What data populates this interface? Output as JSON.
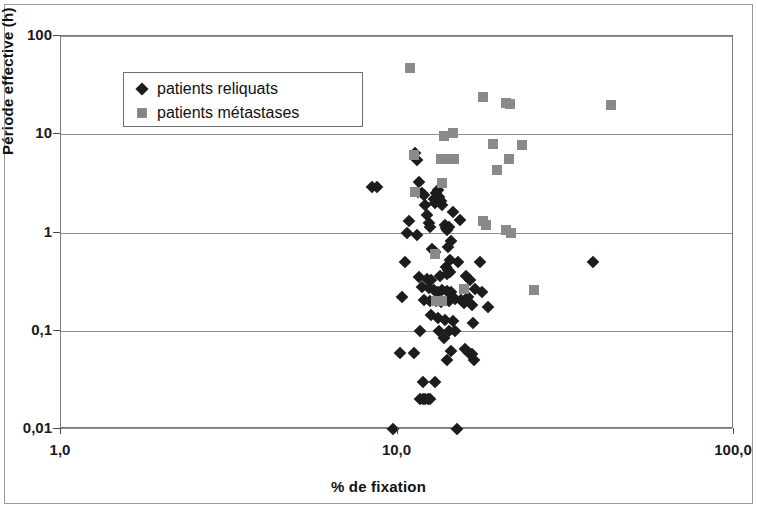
{
  "chart_data": {
    "type": "scatter",
    "title": "",
    "xlabel": "% de fixation",
    "ylabel": "Période effective (h)",
    "xscale": "log",
    "yscale": "log",
    "xlim": [
      1.0,
      100.0
    ],
    "ylim": [
      0.01,
      100
    ],
    "xticks": [
      "1,0",
      "10,0",
      "100,0"
    ],
    "xtick_values": [
      1.0,
      10.0,
      100.0
    ],
    "yticks": [
      "0,01",
      "0,1",
      "1",
      "10",
      "100"
    ],
    "ytick_values": [
      0.01,
      0.1,
      1,
      10,
      100
    ],
    "grid": "horizontal",
    "legend_position": "top-left",
    "series": [
      {
        "name": "patients reliquats",
        "marker": "diamond",
        "color": "#1c1c1c",
        "points": [
          [
            8.4,
            2.9
          ],
          [
            8.7,
            2.9
          ],
          [
            11.3,
            6.4
          ],
          [
            11.4,
            5.5
          ],
          [
            11.6,
            3.3
          ],
          [
            11.5,
            2.6
          ],
          [
            11.8,
            2.5
          ],
          [
            12.0,
            2.4
          ],
          [
            10.8,
            1.3
          ],
          [
            10.7,
            1.0
          ],
          [
            11.4,
            0.95
          ],
          [
            12.1,
            1.9
          ],
          [
            12.2,
            1.5
          ],
          [
            12.4,
            1.25
          ],
          [
            12.5,
            1.15
          ],
          [
            12.8,
            2.2
          ],
          [
            12.9,
            2.0
          ],
          [
            13.0,
            2.5
          ],
          [
            13.2,
            2.7
          ],
          [
            13.3,
            2.3
          ],
          [
            13.5,
            2.1
          ],
          [
            13.6,
            1.9
          ],
          [
            13.8,
            1.2
          ],
          [
            13.9,
            1.1
          ],
          [
            14.0,
            1.05
          ],
          [
            14.2,
            1.15
          ],
          [
            14.6,
            1.6
          ],
          [
            15.3,
            1.35
          ],
          [
            14.4,
            0.82
          ],
          [
            14.1,
            0.72
          ],
          [
            12.7,
            0.68
          ],
          [
            12.9,
            0.63
          ],
          [
            10.5,
            0.5
          ],
          [
            14.3,
            0.52
          ],
          [
            15.1,
            0.5
          ],
          [
            17.6,
            0.5
          ],
          [
            38.0,
            0.5
          ],
          [
            13.9,
            0.45
          ],
          [
            14.1,
            0.42
          ],
          [
            14.3,
            0.4
          ],
          [
            14.0,
            0.38
          ],
          [
            11.6,
            0.35
          ],
          [
            12.2,
            0.34
          ],
          [
            12.6,
            0.33
          ],
          [
            13.4,
            0.36
          ],
          [
            16.0,
            0.36
          ],
          [
            16.4,
            0.33
          ],
          [
            11.8,
            0.28
          ],
          [
            12.4,
            0.27
          ],
          [
            12.8,
            0.26
          ],
          [
            13.2,
            0.25
          ],
          [
            13.6,
            0.26
          ],
          [
            14.0,
            0.255
          ],
          [
            14.4,
            0.25
          ],
          [
            17.0,
            0.265
          ],
          [
            17.8,
            0.25
          ],
          [
            10.3,
            0.22
          ],
          [
            12.0,
            0.205
          ],
          [
            12.5,
            0.2
          ],
          [
            13.0,
            0.2
          ],
          [
            13.5,
            0.195
          ],
          [
            14.2,
            0.2
          ],
          [
            14.8,
            0.21
          ],
          [
            15.4,
            0.205
          ],
          [
            16.2,
            0.22
          ],
          [
            15.8,
            0.19
          ],
          [
            16.6,
            0.185
          ],
          [
            18.6,
            0.175
          ],
          [
            12.6,
            0.145
          ],
          [
            13.2,
            0.135
          ],
          [
            13.8,
            0.13
          ],
          [
            14.6,
            0.125
          ],
          [
            16.8,
            0.12
          ],
          [
            11.7,
            0.1
          ],
          [
            13.3,
            0.1
          ],
          [
            14.2,
            0.1
          ],
          [
            14.8,
            0.1
          ],
          [
            13.7,
            0.085
          ],
          [
            10.2,
            0.06
          ],
          [
            11.2,
            0.06
          ],
          [
            14.4,
            0.062
          ],
          [
            15.9,
            0.065
          ],
          [
            16.3,
            0.06
          ],
          [
            16.7,
            0.058
          ],
          [
            14.0,
            0.05
          ],
          [
            16.9,
            0.05
          ],
          [
            11.9,
            0.03
          ],
          [
            12.9,
            0.03
          ],
          [
            11.7,
            0.02
          ],
          [
            11.9,
            0.02
          ],
          [
            12.1,
            0.02
          ],
          [
            12.3,
            0.02
          ],
          [
            12.5,
            0.02
          ],
          [
            9.7,
            0.01
          ],
          [
            15.0,
            0.01
          ]
        ]
      },
      {
        "name": "patients métastases",
        "marker": "square",
        "color": "#8a8a8a",
        "points": [
          [
            10.9,
            47.0
          ],
          [
            18.0,
            24.0
          ],
          [
            21.0,
            21.0
          ],
          [
            21.6,
            20.5
          ],
          [
            43.0,
            20.0
          ],
          [
            13.7,
            9.5
          ],
          [
            14.6,
            10.2
          ],
          [
            11.2,
            6.2
          ],
          [
            19.2,
            8.0
          ],
          [
            23.5,
            7.7
          ],
          [
            13.5,
            5.6
          ],
          [
            14.1,
            5.6
          ],
          [
            14.7,
            5.6
          ],
          [
            21.4,
            5.6
          ],
          [
            19.7,
            4.3
          ],
          [
            13.6,
            3.2
          ],
          [
            11.3,
            2.6
          ],
          [
            17.9,
            1.3
          ],
          [
            18.3,
            1.2
          ],
          [
            21.0,
            1.05
          ],
          [
            21.8,
            1.0
          ],
          [
            12.9,
            0.6
          ],
          [
            15.8,
            0.265
          ],
          [
            25.5,
            0.26
          ],
          [
            13.6,
            0.2
          ],
          [
            13.0,
            0.2
          ]
        ]
      }
    ]
  },
  "axes": {
    "y_label": "Période effective (h)",
    "x_label": "% de fixation",
    "y_ticks": [
      "100",
      "10",
      "1",
      "0,1",
      "0,01"
    ],
    "x_ticks": [
      "1,0",
      "10,0",
      "100,0"
    ]
  },
  "legend": {
    "items": [
      {
        "label": "patients reliquats",
        "marker": "diamond-marker"
      },
      {
        "label": "patients métastases",
        "marker": "square-marker"
      }
    ]
  }
}
